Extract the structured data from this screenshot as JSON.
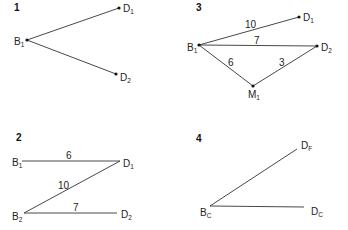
{
  "panels": [
    {
      "id": "1",
      "number": "1",
      "nodes": [
        {
          "id": "B1",
          "base": "B",
          "sub": "1"
        },
        {
          "id": "D1",
          "base": "D",
          "sub": "1"
        },
        {
          "id": "D2",
          "base": "D",
          "sub": "2"
        }
      ],
      "edges": [
        {
          "from": "B1",
          "to": "D1",
          "weight": ""
        },
        {
          "from": "B1",
          "to": "D2",
          "weight": ""
        }
      ]
    },
    {
      "id": "3",
      "number": "3",
      "nodes": [
        {
          "id": "B1",
          "base": "B",
          "sub": "1"
        },
        {
          "id": "D1",
          "base": "D",
          "sub": "1"
        },
        {
          "id": "D2",
          "base": "D",
          "sub": "2"
        },
        {
          "id": "M1",
          "base": "M",
          "sub": "1"
        }
      ],
      "edges": [
        {
          "from": "B1",
          "to": "D1",
          "weight": "10"
        },
        {
          "from": "B1",
          "to": "D2",
          "weight": "7"
        },
        {
          "from": "B1",
          "to": "M1",
          "weight": "6"
        },
        {
          "from": "M1",
          "to": "D2",
          "weight": "3"
        }
      ]
    },
    {
      "id": "2",
      "number": "2",
      "nodes": [
        {
          "id": "B1",
          "base": "B",
          "sub": "1"
        },
        {
          "id": "D1",
          "base": "D",
          "sub": "1"
        },
        {
          "id": "B2",
          "base": "B",
          "sub": "2"
        },
        {
          "id": "D2",
          "base": "D",
          "sub": "2"
        }
      ],
      "edges": [
        {
          "from": "B1",
          "to": "D1",
          "weight": "6"
        },
        {
          "from": "D1",
          "to": "B2",
          "weight": "10"
        },
        {
          "from": "B2",
          "to": "D2",
          "weight": "7"
        }
      ]
    },
    {
      "id": "4",
      "number": "4",
      "nodes": [
        {
          "id": "BC",
          "base": "B",
          "sub": "C"
        },
        {
          "id": "DF",
          "base": "D",
          "sub": "F"
        },
        {
          "id": "DC",
          "base": "D",
          "sub": "C"
        }
      ],
      "edges": [
        {
          "from": "BC",
          "to": "DF",
          "weight": ""
        },
        {
          "from": "BC",
          "to": "DC",
          "weight": ""
        }
      ]
    }
  ]
}
